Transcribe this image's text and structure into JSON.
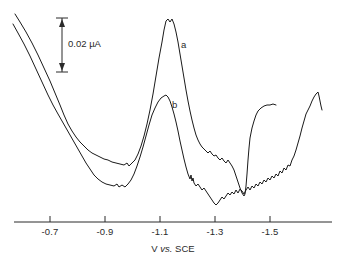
{
  "chart_data": {
    "type": "line",
    "title": "",
    "xlabel": "V vs. SCE",
    "ylabel": "",
    "xlim": [
      -0.62,
      -1.64
    ],
    "grid": false,
    "legend_position": "inline-annotation",
    "xticks": [
      "-0.7",
      "-0.9",
      "-1.1",
      "-1.3",
      "-1.5"
    ],
    "xtick_values": [
      -0.7,
      -0.9,
      -1.1,
      -1.3,
      -1.5
    ],
    "scalebar": {
      "label": "0.02 µA",
      "value": 0.02,
      "units": "µA",
      "orientation": "vertical"
    },
    "annotations": [
      {
        "text": "a",
        "x": -1.15,
        "note": "upper curve label"
      },
      {
        "text": "b",
        "x": -1.12,
        "note": "lower curve label"
      }
    ],
    "series": [
      {
        "name": "a",
        "label": "a",
        "color": "#1a1a1a",
        "description": "Differential pulse voltammogram, upper trace with large peak near -1.11 V",
        "peaks": [
          {
            "x": -1.11,
            "relative_height": 1.0,
            "note": "main peak"
          },
          {
            "x": -1.43,
            "relative_height": 0.42,
            "note": "rising wave plateau"
          }
        ],
        "minima": [
          {
            "x": -0.97,
            "note": "valley before main peak"
          },
          {
            "x": -1.39,
            "note": "trough before final rise"
          }
        ],
        "points_px": [
          [
            15,
            14
          ],
          [
            20,
            22
          ],
          [
            26,
            32
          ],
          [
            32,
            43
          ],
          [
            38,
            55
          ],
          [
            44,
            68
          ],
          [
            50,
            81
          ],
          [
            55,
            93
          ],
          [
            60,
            105
          ],
          [
            64,
            115
          ],
          [
            68,
            124
          ],
          [
            72,
            131
          ],
          [
            76,
            137
          ],
          [
            80,
            142
          ],
          [
            84,
            146
          ],
          [
            88,
            150
          ],
          [
            92,
            153
          ],
          [
            96,
            155
          ],
          [
            100,
            157
          ],
          [
            104,
            159
          ],
          [
            108,
            160
          ],
          [
            112,
            162
          ],
          [
            116,
            163
          ],
          [
            120,
            164
          ],
          [
            124,
            165
          ],
          [
            127,
            163
          ],
          [
            129,
            166
          ],
          [
            132,
            163
          ],
          [
            135,
            160
          ],
          [
            138,
            154
          ],
          [
            141,
            146
          ],
          [
            144,
            136
          ],
          [
            147,
            124
          ],
          [
            150,
            110
          ],
          [
            153,
            94
          ],
          [
            156,
            76
          ],
          [
            159,
            58
          ],
          [
            162,
            42
          ],
          [
            164,
            30
          ],
          [
            166,
            21
          ],
          [
            168,
            19
          ],
          [
            170,
            22
          ],
          [
            172,
            19
          ],
          [
            174,
            24
          ],
          [
            176,
            32
          ],
          [
            178,
            42
          ],
          [
            180,
            54
          ],
          [
            182,
            66
          ],
          [
            184,
            78
          ],
          [
            186,
            90
          ],
          [
            188,
            101
          ],
          [
            190,
            111
          ],
          [
            192,
            120
          ],
          [
            194,
            128
          ],
          [
            196,
            135
          ],
          [
            198,
            140
          ],
          [
            200,
            144
          ],
          [
            202,
            147
          ],
          [
            204,
            149
          ],
          [
            206,
            151
          ],
          [
            208,
            153
          ],
          [
            210,
            151
          ],
          [
            212,
            154
          ],
          [
            214,
            156
          ],
          [
            216,
            155
          ],
          [
            218,
            158
          ],
          [
            220,
            160
          ],
          [
            222,
            158
          ],
          [
            224,
            161
          ],
          [
            226,
            163
          ],
          [
            228,
            160
          ],
          [
            230,
            163
          ],
          [
            232,
            166
          ],
          [
            234,
            170
          ],
          [
            236,
            176
          ],
          [
            238,
            182
          ],
          [
            240,
            188
          ],
          [
            242,
            193
          ],
          [
            244,
            196
          ],
          [
            245,
            194
          ],
          [
            246,
            186
          ],
          [
            247,
            174
          ],
          [
            248,
            160
          ],
          [
            249,
            148
          ],
          [
            250,
            138
          ],
          [
            252,
            128
          ],
          [
            254,
            121
          ],
          [
            256,
            115
          ],
          [
            258,
            111
          ],
          [
            261,
            108
          ],
          [
            264,
            106
          ],
          [
            267,
            105
          ],
          [
            270,
            105
          ],
          [
            273,
            104
          ],
          [
            276,
            105
          ]
        ]
      },
      {
        "name": "b",
        "label": "b",
        "color": "#1a1a1a",
        "description": "Differential pulse voltammogram, lower trace with smaller peak near -1.11 V",
        "peaks": [
          {
            "x": -1.11,
            "relative_height": 0.55,
            "note": "main peak, reduced"
          },
          {
            "x": -1.61,
            "relative_height": 0.45,
            "note": "final rise at negative limit"
          }
        ],
        "minima": [
          {
            "x": -1.0,
            "note": "valley before main peak"
          },
          {
            "x": -1.3,
            "note": "broad noisy trough"
          }
        ],
        "points_px": [
          [
            13,
            24
          ],
          [
            18,
            33
          ],
          [
            24,
            44
          ],
          [
            30,
            56
          ],
          [
            36,
            69
          ],
          [
            42,
            82
          ],
          [
            48,
            95
          ],
          [
            53,
            105
          ],
          [
            58,
            114
          ],
          [
            62,
            121
          ],
          [
            66,
            128
          ],
          [
            70,
            135
          ],
          [
            74,
            142
          ],
          [
            78,
            149
          ],
          [
            82,
            156
          ],
          [
            86,
            163
          ],
          [
            90,
            169
          ],
          [
            94,
            175
          ],
          [
            98,
            179
          ],
          [
            102,
            182
          ],
          [
            106,
            184
          ],
          [
            110,
            185
          ],
          [
            114,
            186
          ],
          [
            117,
            184
          ],
          [
            119,
            187
          ],
          [
            122,
            185
          ],
          [
            125,
            187
          ],
          [
            128,
            184
          ],
          [
            131,
            180
          ],
          [
            134,
            174
          ],
          [
            137,
            166
          ],
          [
            140,
            157
          ],
          [
            143,
            147
          ],
          [
            146,
            136
          ],
          [
            149,
            125
          ],
          [
            152,
            115
          ],
          [
            155,
            108
          ],
          [
            158,
            102
          ],
          [
            161,
            98
          ],
          [
            164,
            96
          ],
          [
            166,
            95
          ],
          [
            168,
            97
          ],
          [
            170,
            101
          ],
          [
            172,
            107
          ],
          [
            174,
            114
          ],
          [
            176,
            122
          ],
          [
            178,
            131
          ],
          [
            180,
            141
          ],
          [
            182,
            150
          ],
          [
            184,
            159
          ],
          [
            186,
            167
          ],
          [
            188,
            174
          ],
          [
            190,
            179
          ],
          [
            191,
            175
          ],
          [
            192,
            181
          ],
          [
            193,
            178
          ],
          [
            194,
            183
          ],
          [
            196,
            186
          ],
          [
            198,
            184
          ],
          [
            200,
            187
          ],
          [
            202,
            190
          ],
          [
            204,
            188
          ],
          [
            206,
            191
          ],
          [
            208,
            194
          ],
          [
            210,
            197
          ],
          [
            212,
            200
          ],
          [
            214,
            203
          ],
          [
            216,
            205
          ],
          [
            218,
            203
          ],
          [
            220,
            200
          ],
          [
            222,
            197
          ],
          [
            224,
            199
          ],
          [
            226,
            196
          ],
          [
            228,
            193
          ],
          [
            230,
            195
          ],
          [
            232,
            192
          ],
          [
            234,
            194
          ],
          [
            236,
            190
          ],
          [
            238,
            193
          ],
          [
            240,
            189
          ],
          [
            242,
            191
          ],
          [
            244,
            194
          ],
          [
            246,
            190
          ],
          [
            248,
            187
          ],
          [
            250,
            190
          ],
          [
            252,
            186
          ],
          [
            254,
            188
          ],
          [
            256,
            184
          ],
          [
            258,
            186
          ],
          [
            260,
            182
          ],
          [
            262,
            184
          ],
          [
            264,
            180
          ],
          [
            266,
            182
          ],
          [
            268,
            178
          ],
          [
            270,
            180
          ],
          [
            272,
            176
          ],
          [
            274,
            178
          ],
          [
            276,
            174
          ],
          [
            278,
            176
          ],
          [
            280,
            171
          ],
          [
            282,
            173
          ],
          [
            284,
            168
          ],
          [
            286,
            170
          ],
          [
            288,
            165
          ],
          [
            290,
            166
          ],
          [
            292,
            160
          ],
          [
            294,
            156
          ],
          [
            296,
            150
          ],
          [
            298,
            143
          ],
          [
            300,
            136
          ],
          [
            302,
            128
          ],
          [
            304,
            121
          ],
          [
            306,
            114
          ],
          [
            308,
            110
          ],
          [
            310,
            106
          ],
          [
            312,
            101
          ],
          [
            314,
            97
          ],
          [
            316,
            94
          ],
          [
            318,
            92
          ],
          [
            319,
            96
          ],
          [
            320,
            101
          ],
          [
            321,
            106
          ],
          [
            322,
            110
          ]
        ]
      }
    ]
  },
  "axis": {
    "title_prefix": "V",
    "title_italic": "vs.",
    "title_suffix": "SCE"
  }
}
